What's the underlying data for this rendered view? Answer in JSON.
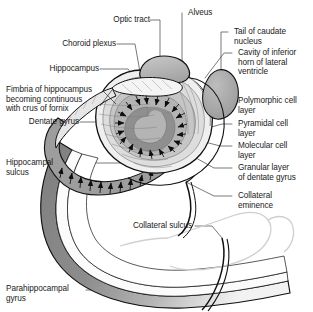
{
  "figure": {
    "domain": "anatomical-diagram",
    "background_color": "#ffffff",
    "outline_color": "#111111",
    "palette": {
      "dark_gray": "#8c8c8c",
      "mid_gray": "#a8a8a8",
      "light_gray": "#d2d2d2",
      "pale_gray": "#e8e8e8",
      "band_gray": "#9a9a9a",
      "text": "#1a1a1a",
      "leader": "#3a3a3a"
    }
  },
  "labels": {
    "optic_tract": "Optic tract",
    "alveus": "Alveus",
    "choroid_plexus": "Choroid plexus",
    "tail_of_caudate_nucleus": "Tail of caudate nucleus",
    "hippocampus": "Hippocampus",
    "cavity_of_inferior_horn": "Cavity of inferior\nhorn of lateral\nventricle",
    "fimbria": "Fimbria of hippocampus\nbecoming continuous\nwith crus of fornix",
    "polymorphic_cell_layer": "Polymorphic cell\nlayer",
    "dentate_gyrus": "Dentate gyrus",
    "pyramidal_cell_layer": "Pyramidal cell\nlayer",
    "molecular_cell_layer": "Molecular cell\nlayer",
    "hippocampal_sulcus": "Hippocampal\nsulcus",
    "granular_layer": "Granular layer\nof dentate gyrus",
    "collateral_eminence": "Collateral\neminence",
    "collateral_sulcus": "Collateral sulcus",
    "parahippocampal_gyrus": "Parahippocampal\ngyrus"
  }
}
